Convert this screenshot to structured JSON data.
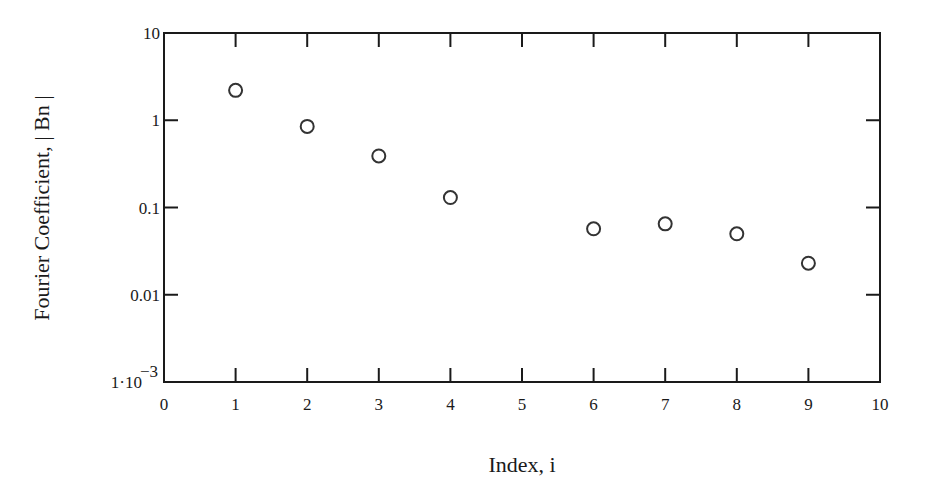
{
  "chart_data": {
    "type": "scatter",
    "title": "",
    "xlabel": "Index, i",
    "ylabel": "Fourier Coefficient, | Bn |",
    "x_scale": "linear",
    "y_scale": "log",
    "xlim": [
      0,
      10
    ],
    "ylim": [
      0.001,
      10
    ],
    "x_ticks": [
      0,
      1,
      2,
      3,
      4,
      5,
      6,
      7,
      8,
      9,
      10
    ],
    "x_tick_labels": [
      "0",
      "1",
      "2",
      "3",
      "4",
      "5",
      "6",
      "7",
      "8",
      "9",
      "10"
    ],
    "y_ticks": [
      10,
      1,
      0.1,
      0.01,
      0.001
    ],
    "y_tick_labels": [
      "10",
      "1",
      "0.1",
      "0.01",
      "1·10⁻³"
    ],
    "grid": false,
    "legend": null,
    "marker": "open-circle",
    "series": [
      {
        "name": "|Bn|",
        "x": [
          1,
          2,
          3,
          4,
          6,
          7,
          8,
          9
        ],
        "y": [
          2.2,
          0.85,
          0.39,
          0.13,
          0.057,
          0.065,
          0.05,
          0.023
        ]
      }
    ]
  },
  "labels": {
    "xlabel": "Index, i",
    "ylabel": "Fourier Coefficient, | Bn |",
    "y_min_mantissa": "1·10",
    "y_min_exponent": "−3"
  },
  "style": {
    "axis_color": "#1a1a1a",
    "marker_color": "#333333",
    "background": "#ffffff"
  }
}
